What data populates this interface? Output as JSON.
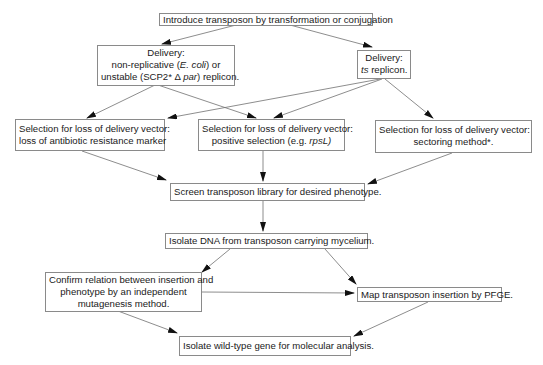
{
  "diagram": {
    "type": "flowchart",
    "nodes": [
      {
        "id": "introduce",
        "lines": [
          "Introduce transposon by transformation or conjugation"
        ]
      },
      {
        "id": "delivery_nonrep",
        "lines": [
          "Delivery:",
          "non-replicative (E. coli) or",
          "unstable (SCP2* Δ par) replicon."
        ]
      },
      {
        "id": "delivery_ts",
        "lines": [
          "Delivery:",
          "ts replicon."
        ]
      },
      {
        "id": "select_antibiotic",
        "lines": [
          "Selection for loss of delivery vector:",
          "loss of antibiotic resistance marker"
        ]
      },
      {
        "id": "select_positive",
        "lines": [
          "Selection for loss of delivery vector:",
          "positive selection (e.g. rpsL)"
        ]
      },
      {
        "id": "select_sectoring",
        "lines": [
          "Selection for loss of delivery vector:",
          "sectoring method*."
        ]
      },
      {
        "id": "screen",
        "lines": [
          "Screen transposon library for desired phenotype."
        ]
      },
      {
        "id": "isolate_dna",
        "lines": [
          "Isolate DNA from transposon carrying mycelium."
        ]
      },
      {
        "id": "confirm",
        "lines": [
          "Confirm relation between insertion and",
          "phenotype by an independent",
          "mutagenesis method."
        ]
      },
      {
        "id": "map",
        "lines": [
          "Map transposon insertion by PFGE."
        ]
      },
      {
        "id": "isolate_gene",
        "lines": [
          "Isolate wild-type gene for molecular analysis."
        ]
      }
    ],
    "edges": [
      {
        "from": "introduce",
        "to": "delivery_nonrep"
      },
      {
        "from": "introduce",
        "to": "delivery_ts"
      },
      {
        "from": "delivery_nonrep",
        "to": "select_antibiotic"
      },
      {
        "from": "delivery_nonrep",
        "to": "select_positive"
      },
      {
        "from": "delivery_ts",
        "to": "select_antibiotic"
      },
      {
        "from": "delivery_ts",
        "to": "select_positive"
      },
      {
        "from": "delivery_ts",
        "to": "select_sectoring"
      },
      {
        "from": "select_antibiotic",
        "to": "screen"
      },
      {
        "from": "select_positive",
        "to": "screen"
      },
      {
        "from": "select_sectoring",
        "to": "screen"
      },
      {
        "from": "screen",
        "to": "isolate_dna"
      },
      {
        "from": "isolate_dna",
        "to": "confirm"
      },
      {
        "from": "isolate_dna",
        "to": "map"
      },
      {
        "from": "confirm",
        "to": "map"
      },
      {
        "from": "confirm",
        "to": "isolate_gene"
      },
      {
        "from": "map",
        "to": "isolate_gene"
      }
    ]
  },
  "text": {
    "introduce": "Introduce transposon by transformation or conjugation",
    "delivery_nonrep_1": "Delivery:",
    "delivery_nonrep_2a": "non-replicative (",
    "delivery_nonrep_2b": "E. coli",
    "delivery_nonrep_2c": ") or",
    "delivery_nonrep_3a": "unstable (SCP2* Δ ",
    "delivery_nonrep_3b": "par",
    "delivery_nonrep_3c": ") replicon.",
    "delivery_ts_1": "Delivery:",
    "delivery_ts_2a": "ts",
    "delivery_ts_2b": " replicon.",
    "select_antibiotic_1": "Selection for loss of delivery vector:",
    "select_antibiotic_2": "loss of antibiotic resistance marker",
    "select_positive_1": "Selection for loss of delivery vector:",
    "select_positive_2a": "positive selection (e.g. ",
    "select_positive_2b": "rpsL)",
    "select_sectoring_1": "Selection for loss of delivery vector:",
    "select_sectoring_2": "sectoring method*.",
    "screen": "Screen transposon library for desired phenotype.",
    "isolate_dna": "Isolate DNA from transposon carrying mycelium.",
    "confirm_1": "Confirm relation between insertion and",
    "confirm_2": "phenotype by an independent",
    "confirm_3": "mutagenesis method.",
    "map": "Map transposon insertion by PFGE.",
    "isolate_gene": "Isolate wild-type gene for molecular analysis."
  },
  "colors": {
    "line": "#707070",
    "arrowhead": "#111111",
    "box_border": "#8a8a8a",
    "text": "#1a1a1a"
  }
}
